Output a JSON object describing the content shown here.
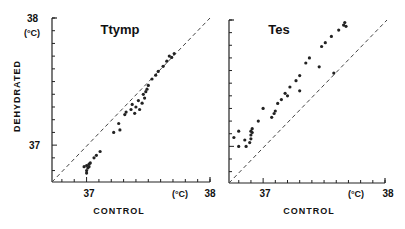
{
  "chart_data": [
    {
      "type": "scatter",
      "title": "Ttymp",
      "xlabel": "CONTROL",
      "ylabel": "DEHYDRATED",
      "unit_label": "(°C)",
      "xlim": [
        36.72,
        38.0
      ],
      "ylim": [
        36.71,
        38.0
      ],
      "x_ticks": [
        "37",
        "38"
      ],
      "y_ticks": [
        "37",
        "38"
      ],
      "identity_line": true,
      "grid": false,
      "points": [
        [
          36.98,
          36.83
        ],
        [
          37.0,
          36.84
        ],
        [
          37.01,
          36.82
        ],
        [
          37.0,
          36.8
        ],
        [
          37.0,
          36.78
        ],
        [
          37.02,
          36.85
        ],
        [
          37.03,
          36.86
        ],
        [
          37.02,
          36.83
        ],
        [
          37.06,
          36.9
        ],
        [
          37.08,
          36.92
        ],
        [
          37.11,
          36.95
        ],
        [
          37.22,
          37.1
        ],
        [
          37.26,
          37.17
        ],
        [
          37.27,
          37.12
        ],
        [
          37.31,
          37.24
        ],
        [
          37.32,
          37.26
        ],
        [
          37.36,
          37.28
        ],
        [
          37.37,
          37.32
        ],
        [
          37.39,
          37.25
        ],
        [
          37.4,
          37.3
        ],
        [
          37.42,
          37.35
        ],
        [
          37.43,
          37.28
        ],
        [
          37.45,
          37.33
        ],
        [
          37.46,
          37.4
        ],
        [
          37.47,
          37.37
        ],
        [
          37.48,
          37.42
        ],
        [
          37.49,
          37.44
        ],
        [
          37.5,
          37.47
        ],
        [
          37.53,
          37.52
        ],
        [
          37.56,
          37.55
        ],
        [
          37.58,
          37.58
        ],
        [
          37.62,
          37.62
        ],
        [
          37.65,
          37.66
        ],
        [
          37.67,
          37.7
        ],
        [
          37.69,
          37.69
        ],
        [
          37.71,
          37.72
        ]
      ]
    },
    {
      "type": "scatter",
      "title": "Tes",
      "xlabel": "CONTROL",
      "ylabel": "",
      "unit_label": "(°C)",
      "xlim": [
        36.72,
        38.0
      ],
      "ylim": [
        36.71,
        38.0
      ],
      "x_ticks": [
        "37",
        "38"
      ],
      "y_ticks": [],
      "identity_line": true,
      "grid": false,
      "points": [
        [
          36.76,
          37.07
        ],
        [
          36.8,
          37.0
        ],
        [
          36.8,
          37.12
        ],
        [
          36.85,
          37.05
        ],
        [
          36.86,
          37.0
        ],
        [
          36.89,
          37.03
        ],
        [
          36.9,
          37.06
        ],
        [
          36.9,
          37.09
        ],
        [
          36.9,
          37.12
        ],
        [
          36.91,
          37.14
        ],
        [
          36.91,
          37.11
        ],
        [
          36.96,
          37.2
        ],
        [
          37.0,
          37.3
        ],
        [
          37.07,
          37.23
        ],
        [
          37.09,
          37.26
        ],
        [
          37.1,
          37.28
        ],
        [
          37.12,
          37.34
        ],
        [
          37.15,
          37.37
        ],
        [
          37.18,
          37.42
        ],
        [
          37.2,
          37.4
        ],
        [
          37.22,
          37.47
        ],
        [
          37.27,
          37.52
        ],
        [
          37.3,
          37.56
        ],
        [
          37.3,
          37.44
        ],
        [
          37.35,
          37.66
        ],
        [
          37.38,
          37.7
        ],
        [
          37.46,
          37.63
        ],
        [
          37.48,
          37.79
        ],
        [
          37.51,
          37.82
        ],
        [
          37.56,
          37.87
        ],
        [
          37.58,
          37.58
        ],
        [
          37.62,
          37.92
        ],
        [
          37.66,
          37.96
        ],
        [
          37.67,
          37.98
        ],
        [
          37.68,
          37.95
        ]
      ]
    }
  ],
  "panels": {
    "left": {
      "title": "Ttymp",
      "y_top_tick": "38",
      "y_unit": "(°C)",
      "y_mid_tick": "37",
      "x_tick_37": "37",
      "x_unit": "(°C)",
      "x_tick_38": "38",
      "y_axis_label": "DEHYDRATED",
      "x_axis_label": "CONTROL"
    },
    "right": {
      "title": "Tes",
      "x_tick_37": "37",
      "x_unit": "(°C)",
      "x_tick_38": "38",
      "x_axis_label": "CONTROL"
    }
  }
}
